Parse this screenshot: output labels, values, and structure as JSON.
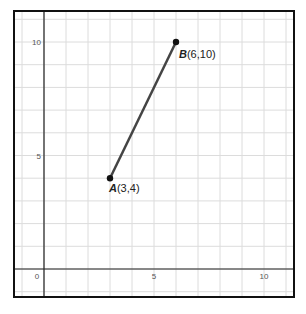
{
  "chart_data": {
    "type": "line",
    "title": "",
    "xlabel": "",
    "ylabel": "",
    "xlim": [
      -1.4,
      11.4
    ],
    "ylim": [
      -1.25,
      11.3
    ],
    "grid": true,
    "x_ticks": [
      0,
      5,
      10
    ],
    "y_ticks": [
      5,
      10
    ],
    "x_tick_labels": [
      "0",
      "5",
      "10"
    ],
    "y_tick_labels": [
      "5",
      "10"
    ],
    "series": [
      {
        "name": "segment AB",
        "points": [
          {
            "label": "A",
            "coord_text": "(3,4)",
            "x": 3,
            "y": 4
          },
          {
            "label": "B",
            "coord_text": "(6,10)",
            "x": 6,
            "y": 10
          }
        ],
        "color": "#444444"
      }
    ]
  }
}
